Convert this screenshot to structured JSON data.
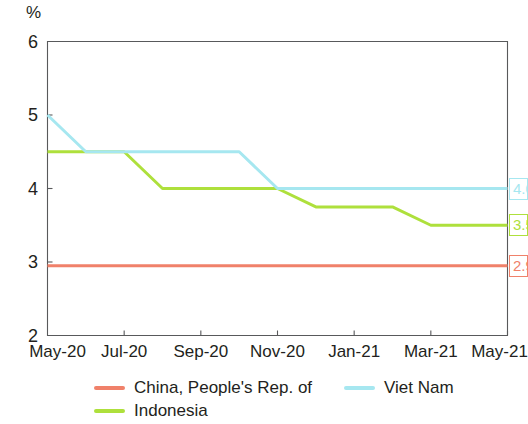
{
  "chart_data": {
    "type": "line",
    "title": "",
    "subtitle": "",
    "xlabel": "",
    "ylabel": "%",
    "ylim": [
      2,
      6
    ],
    "yticks": [
      "2",
      "3",
      "4",
      "5",
      "6"
    ],
    "ytick_values": [
      2,
      3,
      4,
      5,
      6
    ],
    "grid": false,
    "legend_position": "bottom",
    "x_categories": [
      "May-20",
      "Jul-20",
      "Sep-20",
      "Nov-20",
      "Jan-21",
      "Mar-21",
      "May-21"
    ],
    "x_range_months": [
      "2020-05",
      "2021-05"
    ],
    "series": [
      {
        "name": "China, People's Rep. of",
        "color": "#f0816a",
        "end_label": "2.9",
        "points": [
          {
            "x": "May-20",
            "y": 2.95
          },
          {
            "x": "Jul-20",
            "y": 2.95
          },
          {
            "x": "Sep-20",
            "y": 2.95
          },
          {
            "x": "Nov-20",
            "y": 2.95
          },
          {
            "x": "Jan-21",
            "y": 2.95
          },
          {
            "x": "Mar-21",
            "y": 2.95
          },
          {
            "x": "May-21",
            "y": 2.95
          }
        ]
      },
      {
        "name": "Indonesia",
        "color": "#aee03c",
        "end_label": "3.5",
        "points": [
          {
            "x": "May-20",
            "y": 4.5
          },
          {
            "x": "Jun-20",
            "y": 4.5
          },
          {
            "x": "Jul-20",
            "y": 4.5
          },
          {
            "x": "Aug-20",
            "y": 4.0
          },
          {
            "x": "Sep-20",
            "y": 4.0
          },
          {
            "x": "Oct-20",
            "y": 4.0
          },
          {
            "x": "Nov-20",
            "y": 4.0
          },
          {
            "x": "Dec-20",
            "y": 3.75
          },
          {
            "x": "Jan-21",
            "y": 3.75
          },
          {
            "x": "Feb-21",
            "y": 3.75
          },
          {
            "x": "Mar-21",
            "y": 3.5
          },
          {
            "x": "Apr-21",
            "y": 3.5
          },
          {
            "x": "May-21",
            "y": 3.5
          }
        ]
      },
      {
        "name": "Viet Nam",
        "color": "#a6e7f0",
        "end_label": "4.0",
        "points": [
          {
            "x": "May-20",
            "y": 5.0
          },
          {
            "x": "Jun-20",
            "y": 4.5
          },
          {
            "x": "Jul-20",
            "y": 4.5
          },
          {
            "x": "Aug-20",
            "y": 4.5
          },
          {
            "x": "Sep-20",
            "y": 4.5
          },
          {
            "x": "Oct-20",
            "y": 4.5
          },
          {
            "x": "Nov-20",
            "y": 4.0
          },
          {
            "x": "Dec-20",
            "y": 4.0
          },
          {
            "x": "Jan-21",
            "y": 4.0
          },
          {
            "x": "Feb-21",
            "y": 4.0
          },
          {
            "x": "Mar-21",
            "y": 4.0
          },
          {
            "x": "Apr-21",
            "y": 4.0
          },
          {
            "x": "May-21",
            "y": 4.0
          }
        ]
      }
    ]
  },
  "axis": {
    "unit_label": "%",
    "frame_color": "#58595b"
  },
  "legend": {
    "items": [
      {
        "label": "China, People's Rep. of",
        "color": "#f0816a"
      },
      {
        "label": "Indonesia",
        "color": "#aee03c"
      },
      {
        "label": "Viet Nam",
        "color": "#a6e7f0"
      }
    ]
  }
}
